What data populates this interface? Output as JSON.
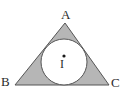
{
  "figure": {
    "kind": "inscribed-circle-triangle",
    "background_color": "#ffffff",
    "triangle": {
      "fill_color": "#b6b6b6",
      "stroke_color": "#555555",
      "stroke_width": 1,
      "vertices": [
        {
          "name": "A",
          "label": "A",
          "x": 65,
          "y": 23
        },
        {
          "name": "B",
          "label": "B",
          "x": 15,
          "y": 85
        },
        {
          "name": "C",
          "label": "C",
          "x": 109,
          "y": 85
        }
      ]
    },
    "incircle": {
      "fill_color": "#ffffff",
      "stroke_color": "#555555",
      "stroke_width": 1,
      "center_x": 64,
      "center_y": 62,
      "radius": 23
    },
    "incenter": {
      "label": "I",
      "dot_color": "#1a1a1a",
      "dot_x": 64,
      "dot_y": 56,
      "dot_radius": 1.6,
      "label_x": 60,
      "label_y": 58
    },
    "labels": {
      "apex": "A",
      "bottom_left": "B",
      "bottom_right": "C",
      "center": "I"
    }
  }
}
